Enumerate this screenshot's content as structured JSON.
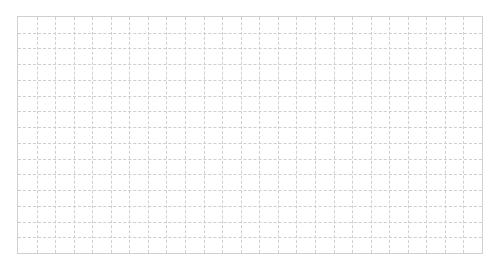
{
  "grid": {
    "columns": 25,
    "rows": 15,
    "line_color": "#cfcfcf",
    "background": "#ffffff"
  }
}
